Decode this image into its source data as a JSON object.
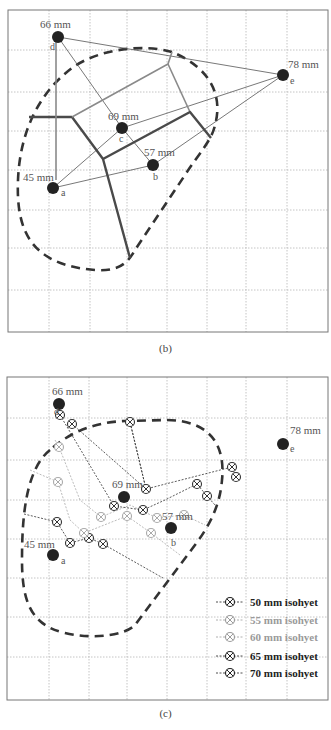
{
  "figure": {
    "panels": [
      {
        "id": "b",
        "caption": "(b)",
        "frame": {
          "x": 8,
          "y": 10,
          "w": 320,
          "h": 322
        },
        "grid_x": [
          49,
          90,
          127,
          167,
          207,
          246,
          287
        ],
        "grid_y": [
          50,
          92,
          131,
          170,
          210,
          248,
          290
        ],
        "stations": [
          {
            "id": "d",
            "label": "66 mm",
            "value": 66,
            "x": 58,
            "y": 37,
            "lx": 40,
            "ly": 28,
            "ix": 50,
            "iy": 50
          },
          {
            "id": "e",
            "label": "78 mm",
            "value": 78,
            "x": 283,
            "y": 75,
            "lx": 288,
            "ly": 68,
            "ix": 290,
            "iy": 84
          },
          {
            "id": "c",
            "label": "69 mm",
            "value": 69,
            "x": 122,
            "y": 128,
            "lx": 108,
            "ly": 120,
            "ix": 119,
            "iy": 142
          },
          {
            "id": "b",
            "label": "57 mm",
            "value": 57,
            "x": 153,
            "y": 165,
            "lx": 144,
            "ly": 156,
            "ix": 153,
            "iy": 180
          },
          {
            "id": "a",
            "label": "45 mm",
            "value": 45,
            "x": 53,
            "y": 188,
            "lx": 23,
            "ly": 181,
            "ix": 61,
            "iy": 196
          }
        ],
        "triangulation": [
          [
            "d",
            "e"
          ],
          [
            "d",
            "c"
          ],
          [
            "c",
            "b"
          ],
          [
            "a",
            "c"
          ],
          [
            "a",
            "b"
          ],
          [
            "c",
            "e"
          ],
          [
            "b",
            "e"
          ]
        ],
        "thiessen_lines": [
          {
            "tone": "dark",
            "points": [
              [
                29,
                117
              ],
              [
                72,
                117
              ],
              [
                103,
                159
              ],
              [
                130,
                258
              ]
            ]
          },
          {
            "tone": "light",
            "points": [
              [
                72,
                117
              ],
              [
                168,
                64
              ],
              [
                172,
                52
              ]
            ]
          },
          {
            "tone": "light",
            "points": [
              [
                168,
                64
              ],
              [
                190,
                112
              ]
            ]
          },
          {
            "tone": "dark",
            "points": [
              [
                103,
                159
              ],
              [
                190,
                112
              ],
              [
                211,
                138
              ]
            ]
          },
          {
            "tone": "light",
            "points": [
              [
                56,
                40
              ],
              [
                56,
                180
              ]
            ]
          }
        ],
        "catchment": "M 172 52 C 145 44, 100 48, 72 68 C 40 92, 20 130, 18 180 C 16 230, 30 265, 95 270 C 120 272, 128 262, 135 250 L 185 175 C 200 152, 212 140, 215 125 C 222 100, 215 70, 172 52 Z"
      },
      {
        "id": "c",
        "caption": "(c)",
        "frame": {
          "x": 7,
          "y": 377,
          "w": 321,
          "h": 323
        },
        "grid_x": [
          49,
          89,
          127,
          167,
          207,
          246,
          287
        ],
        "grid_y": [
          418,
          460,
          500,
          539,
          578,
          617,
          657
        ],
        "stations": [
          {
            "id": "d",
            "label": "66 mm",
            "value": 66,
            "x": 59,
            "y": 404,
            "lx": 52,
            "ly": 395,
            "ix": 54,
            "iy": 415
          },
          {
            "id": "e",
            "label": "78 mm",
            "value": 78,
            "x": 283,
            "y": 444,
            "lx": 290,
            "ly": 434,
            "ix": 290,
            "iy": 452
          },
          {
            "id": "c",
            "label": "69 mm",
            "value": 69,
            "x": 124,
            "y": 497,
            "lx": 112,
            "ly": 488,
            "ix": 0,
            "iy": 0
          },
          {
            "id": "b",
            "label": "57 mm",
            "value": 57,
            "x": 171,
            "y": 528,
            "lx": 162,
            "ly": 520,
            "ix": 171,
            "iy": 546
          },
          {
            "id": "a",
            "label": "45 mm",
            "value": 45,
            "x": 53,
            "y": 555,
            "lx": 24,
            "ly": 548,
            "ix": 61,
            "iy": 564
          }
        ],
        "isohyets": [
          {
            "name": "50 mm isohyet",
            "color": "#333333",
            "bold": true,
            "line": [
              [
                24,
                514
              ],
              [
                57,
                522
              ],
              [
                70,
                543
              ],
              [
                89,
                538
              ],
              [
                103,
                544
              ],
              [
                163,
                578
              ]
            ],
            "markers": [
              [
                57,
                522
              ],
              [
                70,
                543
              ],
              [
                89,
                538
              ],
              [
                103,
                544
              ]
            ]
          },
          {
            "name": "55 mm isohyet",
            "color": "#aaaaaa",
            "bold": false,
            "line": [
              [
                30,
                470
              ],
              [
                58,
                482
              ],
              [
                70,
                520
              ],
              [
                84,
                533
              ],
              [
                127,
                516
              ],
              [
                151,
                533
              ],
              [
                180,
                555
              ]
            ],
            "markers": [
              [
                58,
                482
              ],
              [
                84,
                533
              ],
              [
                127,
                516
              ],
              [
                151,
                533
              ]
            ]
          },
          {
            "name": "60 mm isohyet",
            "color": "#aaaaaa",
            "bold": false,
            "line": [
              [
                55,
                440
              ],
              [
                59,
                447
              ],
              [
                80,
                500
              ],
              [
                101,
                517
              ],
              [
                130,
                505
              ],
              [
                157,
                518
              ],
              [
                184,
                515
              ],
              [
                205,
                525
              ]
            ],
            "markers": [
              [
                59,
                447
              ],
              [
                101,
                517
              ],
              [
                157,
                518
              ],
              [
                184,
                515
              ]
            ]
          },
          {
            "name": "65 mm isohyet",
            "color": "#333333",
            "bold": true,
            "line": [
              [
                60,
                415
              ],
              [
                114,
                506
              ],
              [
                143,
                510
              ],
              [
                165,
                500
              ],
              [
                197,
                484
              ],
              [
                207,
                496
              ],
              [
                215,
                505
              ]
            ],
            "markers": [
              [
                60,
                415
              ],
              [
                114,
                506
              ],
              [
                143,
                510
              ],
              [
                197,
                484
              ],
              [
                207,
                496
              ]
            ]
          },
          {
            "name": "70 mm isohyet",
            "color": "#333333",
            "bold": true,
            "line": [
              [
                72,
                424
              ],
              [
                146,
                489
              ],
              [
                130,
                422
              ],
              [
                146,
                489
              ],
              [
                232,
                467
              ],
              [
                236,
                477
              ]
            ],
            "markers": [
              [
                72,
                424
              ],
              [
                130,
                422
              ],
              [
                146,
                489
              ],
              [
                232,
                467
              ],
              [
                236,
                477
              ]
            ]
          }
        ],
        "catchment": "M 50 450 C 25 470, 22 520, 22 560 C 22 600, 30 625, 65 633 C 95 640, 125 635, 135 625 L 195 545 C 210 525, 220 505, 222 480 C 225 450, 215 420, 165 420 L 125 421 C 95 422, 70 432, 50 450 Z",
        "legend": [
          {
            "label": "50 mm isohyet",
            "color": "#222222",
            "x": 230,
            "y": 602
          },
          {
            "label": "55 mm isohyet",
            "color": "#9a9a9a",
            "x": 230,
            "y": 620
          },
          {
            "label": "60 mm isohyet",
            "color": "#9a9a9a",
            "x": 230,
            "y": 637
          },
          {
            "label": "65 mm isohyet",
            "color": "#222222",
            "x": 230,
            "y": 656
          },
          {
            "label": "70 mm isohyet",
            "color": "#222222",
            "x": 230,
            "y": 673
          }
        ]
      }
    ],
    "colors": {
      "station": "#222222",
      "label": "#555555",
      "grid": "#b5b5b5",
      "thiessen_dark": "#4a4a4a",
      "thiessen_light": "#8a8a8a",
      "triangulation": "#555555",
      "catchment": "#333333",
      "frame": "#777777"
    }
  }
}
